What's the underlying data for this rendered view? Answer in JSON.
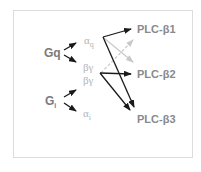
{
  "diagram": {
    "type": "signaling-pathway",
    "g_proteins": [
      {
        "id": "gq",
        "label": "Gq",
        "subunits": [
          "αq",
          "βγ"
        ]
      },
      {
        "id": "gi",
        "label": "G",
        "subscript": "i",
        "subunits": [
          "βγ",
          "αi"
        ]
      }
    ],
    "subunits": {
      "gq_alpha": {
        "label": "α",
        "subscript": "q"
      },
      "gq_betagamma": {
        "label": "βγ"
      },
      "gi_betagamma": {
        "label": "βγ"
      },
      "gi_alpha": {
        "label": "α",
        "subscript": "i"
      }
    },
    "targets": [
      {
        "id": "plcb1",
        "label": "PLC-β1"
      },
      {
        "id": "plcb2",
        "label": "PLC-β2"
      },
      {
        "id": "plcb3",
        "label": "PLC-β3"
      }
    ],
    "edges": [
      {
        "from": "αq",
        "to": "PLC-β1",
        "style": "solid-black"
      },
      {
        "from": "αq",
        "to": "PLC-β3",
        "style": "solid-black"
      },
      {
        "from": "αq",
        "to": "PLC-β2",
        "style": "solid-light-grey"
      },
      {
        "from": "βγ",
        "to": "PLC-β2",
        "style": "solid-black"
      },
      {
        "from": "βγ",
        "to": "PLC-β3",
        "style": "solid-black"
      },
      {
        "from": "βγ",
        "to": "PLC-β1",
        "style": "dashed-light-grey"
      }
    ],
    "colors": {
      "strong_arrow": "#1a1a1a",
      "weak_arrow": "#c8c8c8",
      "subunit_text": "#b4b4b4",
      "label_text": "#7a7a7a",
      "frame": "#dcdcdc"
    }
  }
}
